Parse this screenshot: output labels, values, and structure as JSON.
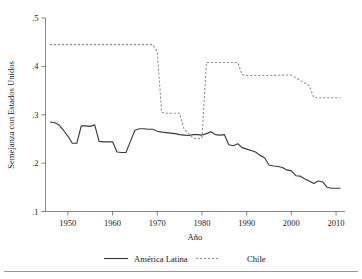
{
  "chart_data": {
    "type": "line",
    "title": "",
    "subtitle": "",
    "xlabel": "Año",
    "ylabel": "Semejanza con Estados Unidos",
    "xlim": [
      1945,
      2012
    ],
    "ylim": [
      0.1,
      0.5
    ],
    "xticks": [
      1950,
      1960,
      1970,
      1980,
      1990,
      2000,
      2010
    ],
    "xticklabels": [
      "1950",
      "1960",
      "1970",
      "1980",
      "1990",
      "2000",
      "2010"
    ],
    "yticks": [
      0.1,
      0.2,
      0.3,
      0.4,
      0.5
    ],
    "yticklabels": [
      ".1",
      ".2",
      ".3",
      ".4",
      ".5"
    ],
    "grid": false,
    "legend_position": "bottom",
    "series": [
      {
        "name": "América Latina",
        "style": "solid",
        "color": "#3a3a3a",
        "x": [
          1946,
          1947,
          1948,
          1949,
          1950,
          1951,
          1952,
          1953,
          1954,
          1955,
          1956,
          1957,
          1958,
          1959,
          1960,
          1961,
          1962,
          1963,
          1964,
          1965,
          1966,
          1967,
          1968,
          1969,
          1970,
          1971,
          1972,
          1973,
          1974,
          1975,
          1976,
          1977,
          1978,
          1979,
          1980,
          1981,
          1982,
          1983,
          1984,
          1985,
          1986,
          1987,
          1988,
          1989,
          1990,
          1991,
          1992,
          1993,
          1994,
          1995,
          1996,
          1997,
          1998,
          1999,
          2000,
          2001,
          2002,
          2003,
          2004,
          2005,
          2006,
          2007,
          2008,
          2009,
          2010,
          2011
        ],
        "y": [
          0.285,
          0.284,
          0.279,
          0.268,
          0.256,
          0.241,
          0.241,
          0.277,
          0.277,
          0.276,
          0.279,
          0.245,
          0.244,
          0.244,
          0.244,
          0.223,
          0.222,
          0.222,
          0.245,
          0.268,
          0.271,
          0.271,
          0.27,
          0.27,
          0.266,
          0.264,
          0.263,
          0.262,
          0.261,
          0.259,
          0.258,
          0.257,
          0.259,
          0.259,
          0.258,
          0.261,
          0.265,
          0.259,
          0.258,
          0.259,
          0.238,
          0.236,
          0.24,
          0.232,
          0.229,
          0.226,
          0.223,
          0.216,
          0.211,
          0.196,
          0.194,
          0.193,
          0.191,
          0.186,
          0.184,
          0.174,
          0.173,
          0.167,
          0.163,
          0.158,
          0.163,
          0.161,
          0.15,
          0.148,
          0.148,
          0.148
        ]
      },
      {
        "name": "Chile",
        "style": "dashed",
        "color": "#8e8e8e",
        "x": [
          1946,
          1950,
          1955,
          1960,
          1965,
          1969,
          1970,
          1971,
          1972,
          1975,
          1976,
          1978,
          1979,
          1980,
          1981,
          1985,
          1988,
          1989,
          1990,
          1995,
          1999,
          2000,
          2004,
          2005,
          2006,
          2010,
          2011
        ],
        "y": [
          0.445,
          0.445,
          0.445,
          0.445,
          0.445,
          0.445,
          0.43,
          0.305,
          0.303,
          0.303,
          0.27,
          0.252,
          0.25,
          0.252,
          0.408,
          0.408,
          0.408,
          0.383,
          0.381,
          0.381,
          0.382,
          0.382,
          0.36,
          0.336,
          0.335,
          0.335,
          0.335
        ]
      }
    ]
  },
  "legend": {
    "items": [
      {
        "label": "América Latina",
        "style": "solid"
      },
      {
        "label": "Chile",
        "style": "dashed"
      }
    ]
  },
  "axis": {
    "x_title": "Año",
    "y_title": "Semejanza con Estados Unidos"
  }
}
